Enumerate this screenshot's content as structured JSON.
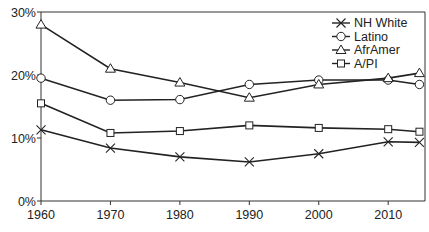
{
  "chart_data": {
    "type": "line",
    "title": "",
    "xlabel": "",
    "ylabel": "",
    "x": [
      1960,
      1970,
      1980,
      1990,
      2000,
      2010,
      2014.5
    ],
    "xlim": [
      1960,
      2015
    ],
    "ylim": [
      0,
      30
    ],
    "x_ticks": [
      1960,
      1970,
      1980,
      1990,
      2000,
      2010
    ],
    "x_tick_labels": [
      "1960",
      "1970",
      "1980",
      "1990",
      "2000",
      "2010"
    ],
    "y_ticks": [
      0,
      10,
      20,
      30
    ],
    "y_tick_labels": [
      "0%",
      "10%",
      "20%",
      "30%"
    ],
    "grid": false,
    "legend_position": "top-right",
    "series": [
      {
        "name": "NH White",
        "marker": "x",
        "values": [
          11.3,
          8.4,
          7.0,
          6.2,
          7.5,
          9.4,
          9.3
        ]
      },
      {
        "name": "Latino",
        "marker": "circle",
        "values": [
          19.5,
          16.0,
          16.1,
          18.5,
          19.2,
          19.2,
          18.5
        ]
      },
      {
        "name": "AfrAmer",
        "marker": "triangle",
        "values": [
          28.0,
          21.0,
          18.8,
          16.4,
          18.5,
          19.5,
          20.3
        ]
      },
      {
        "name": "A/PI",
        "marker": "square",
        "values": [
          15.5,
          10.8,
          11.1,
          12.0,
          11.6,
          11.4,
          11.0
        ]
      }
    ]
  }
}
